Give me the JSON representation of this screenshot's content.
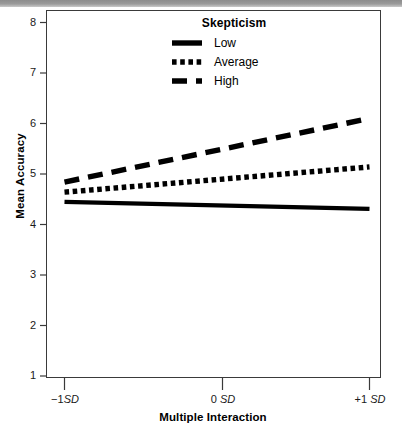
{
  "figure": {
    "y_axis_title": "Mean Accuracy",
    "x_axis_title": "Multiple Interaction"
  },
  "legend": {
    "title": "Skepticism",
    "entries": [
      {
        "label": "Low",
        "style": "solid",
        "key": "legend-key-low"
      },
      {
        "label": "Average",
        "style": "dotted",
        "key": "legend-key-average"
      },
      {
        "label": "High",
        "style": "dashed",
        "key": "legend-key-high"
      }
    ]
  },
  "axes": {
    "y_ticks": [
      "8",
      "7",
      "6",
      "5",
      "4",
      "3",
      "2",
      "1"
    ],
    "x_ticks": [
      {
        "sign": "−1",
        "unit": "SD"
      },
      {
        "sign": "0",
        "unit": "SD"
      },
      {
        "sign": "+1",
        "unit": "SD"
      }
    ]
  },
  "chart_data": {
    "type": "line",
    "title": "",
    "xlabel": "Multiple Interaction",
    "ylabel": "Mean Accuracy",
    "x": [
      "-1 SD",
      "0 SD",
      "+1 SD"
    ],
    "x_numeric": [
      -1,
      0,
      1
    ],
    "ylim": [
      1,
      8
    ],
    "xlim": [
      -1,
      1
    ],
    "yticks": [
      1,
      2,
      3,
      4,
      5,
      6,
      7,
      8
    ],
    "grid": false,
    "legend_title": "Skepticism",
    "legend_position": "top-center-inside",
    "series": [
      {
        "name": "Low",
        "style": "solid",
        "color": "#000000",
        "values": [
          4.45,
          4.38,
          4.31
        ]
      },
      {
        "name": "Average",
        "style": "dotted",
        "color": "#000000",
        "values": [
          4.64,
          4.89,
          5.14
        ]
      },
      {
        "name": "High",
        "style": "dashed",
        "color": "#000000",
        "values": [
          4.84,
          5.47,
          6.1
        ]
      }
    ]
  }
}
